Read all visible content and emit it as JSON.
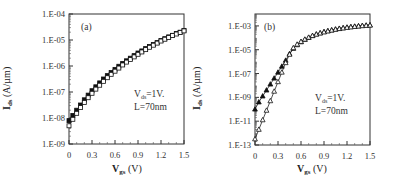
{
  "chart_data": [
    {
      "type": "scatter",
      "panel_label": "(a)",
      "xlabel": "Vgs (V)",
      "xlabel_main": "V",
      "xlabel_sub": "gs",
      "xlabel_unit": " (V)",
      "ylabel": "Ids (A/µm)",
      "ylabel_main": "I",
      "ylabel_sub": "ds",
      "ylabel_unit": " (A/µm)",
      "xlim": [
        0,
        1.5
      ],
      "ylim": [
        1e-09,
        0.0001
      ],
      "yscale": "log",
      "x_ticks": [
        "0",
        "0.3",
        "0.6",
        "0.9",
        "1.2",
        "1.5"
      ],
      "y_ticks": [
        "1.E-04",
        "1.E-05",
        "1.E-06",
        "1.E-07",
        "1.E-08",
        "1.E-09"
      ],
      "annotations": {
        "line1_main": "V",
        "line1_sub": "ds",
        "line1_rest": "=1V.",
        "line2": "L=70nm"
      },
      "grid": false,
      "series": [
        {
          "name": "filled squares",
          "marker": "filled-square",
          "x": [
            0,
            0.05,
            0.1,
            0.15,
            0.2,
            0.25,
            0.3,
            0.35,
            0.4,
            0.45,
            0.5,
            0.55,
            0.6,
            0.65,
            0.7,
            0.75,
            0.8,
            0.85,
            0.9,
            0.95,
            1.0,
            1.05,
            1.1,
            1.15,
            1.2,
            1.25,
            1.3,
            1.35,
            1.4,
            1.45,
            1.5
          ],
          "log10_y": [
            -8.1,
            -7.9,
            -7.7,
            -7.5,
            -7.3,
            -7.12,
            -6.95,
            -6.8,
            -6.65,
            -6.5,
            -6.37,
            -6.25,
            -6.13,
            -6.01,
            -5.9,
            -5.8,
            -5.7,
            -5.6,
            -5.5,
            -5.42,
            -5.33,
            -5.25,
            -5.17,
            -5.1,
            -5.02,
            -4.95,
            -4.88,
            -4.82,
            -4.75,
            -4.7,
            -4.63
          ]
        },
        {
          "name": "open squares",
          "marker": "open-square",
          "x": [
            0,
            0.05,
            0.1,
            0.15,
            0.2,
            0.25,
            0.3,
            0.35,
            0.4,
            0.45,
            0.5,
            0.55,
            0.6,
            0.65,
            0.7,
            0.75,
            0.8,
            0.85,
            0.9,
            0.95,
            1.0,
            1.05,
            1.1,
            1.15,
            1.2,
            1.25,
            1.3,
            1.35,
            1.4,
            1.45,
            1.5
          ],
          "log10_y": [
            -8.3,
            -8.05,
            -7.82,
            -7.6,
            -7.4,
            -7.22,
            -7.05,
            -6.89,
            -6.74,
            -6.59,
            -6.45,
            -6.32,
            -6.2,
            -6.08,
            -5.96,
            -5.85,
            -5.75,
            -5.65,
            -5.55,
            -5.46,
            -5.37,
            -5.28,
            -5.2,
            -5.12,
            -5.04,
            -4.97,
            -4.9,
            -4.83,
            -4.77,
            -4.71,
            -4.65
          ]
        }
      ]
    },
    {
      "type": "scatter",
      "panel_label": "(b)",
      "xlabel": "Vgs (V)",
      "xlabel_main": "V",
      "xlabel_sub": "gs",
      "xlabel_unit": " (V)",
      "ylabel": "Ids (A/µm)",
      "ylabel_main": "I",
      "ylabel_sub": "ds",
      "ylabel_unit": " (A/µm)",
      "xlim": [
        0,
        1.5
      ],
      "ylim": [
        1e-13,
        0.01
      ],
      "yscale": "log",
      "x_ticks": [
        "0",
        "0.3",
        "0.6",
        "0.9",
        "1.2",
        "1.5"
      ],
      "y_ticks": [
        "1.E-03",
        "1.E-05",
        "1.E-07",
        "1.E-09",
        "1.E-11",
        "1.E-13"
      ],
      "annotations": {
        "line1_main": "V",
        "line1_sub": "ds",
        "line1_rest": "=1V.",
        "line2": "L=70nm"
      },
      "grid": false,
      "series": [
        {
          "name": "filled triangles",
          "marker": "filled-triangle",
          "x": [
            0,
            0.05,
            0.1,
            0.15,
            0.2,
            0.25,
            0.3,
            0.35,
            0.4,
            0.45,
            0.5,
            0.55,
            0.6,
            0.65,
            0.7,
            0.75,
            0.8,
            0.85,
            0.9,
            0.95,
            1.0,
            1.05,
            1.1,
            1.15,
            1.2,
            1.25,
            1.3,
            1.35,
            1.4,
            1.45,
            1.5
          ],
          "log10_y": [
            -10.0,
            -9.4,
            -8.9,
            -8.4,
            -7.9,
            -7.4,
            -6.9,
            -6.4,
            -5.9,
            -5.35,
            -4.9,
            -4.6,
            -4.35,
            -4.15,
            -3.98,
            -3.83,
            -3.7,
            -3.6,
            -3.5,
            -3.42,
            -3.35,
            -3.28,
            -3.22,
            -3.17,
            -3.12,
            -3.08,
            -3.04,
            -3.01,
            -2.98,
            -2.95,
            -2.93
          ]
        },
        {
          "name": "open triangles",
          "marker": "open-triangle",
          "x": [
            0,
            0.05,
            0.1,
            0.15,
            0.2,
            0.25,
            0.3,
            0.35,
            0.4,
            0.45,
            0.5,
            0.55,
            0.6,
            0.65,
            0.7,
            0.75,
            0.8,
            0.85,
            0.9,
            0.95,
            1.0,
            1.05,
            1.1,
            1.15,
            1.2,
            1.25,
            1.3,
            1.35,
            1.4,
            1.45,
            1.5
          ],
          "log10_y": [
            -12.5,
            -11.7,
            -10.9,
            -10.1,
            -9.3,
            -8.5,
            -7.7,
            -6.9,
            -6.1,
            -5.4,
            -4.85,
            -4.55,
            -4.32,
            -4.13,
            -3.97,
            -3.83,
            -3.71,
            -3.61,
            -3.52,
            -3.44,
            -3.37,
            -3.3,
            -3.24,
            -3.19,
            -3.14,
            -3.1,
            -3.06,
            -3.03,
            -3.0,
            -2.97,
            -2.95
          ]
        }
      ]
    }
  ]
}
